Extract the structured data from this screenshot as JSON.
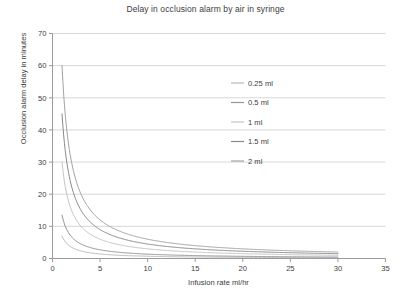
{
  "chart_data": {
    "type": "line",
    "title": "Delay in occlusion alarm by air in syringe",
    "xlabel": "Infusion rate ml/hr",
    "ylabel": "Occlusion alarm delay in minutes",
    "xlim": [
      0,
      35
    ],
    "ylim": [
      0,
      70
    ],
    "xticks": [
      0,
      5,
      10,
      15,
      20,
      25,
      30,
      35
    ],
    "yticks": [
      0,
      10,
      20,
      30,
      40,
      50,
      60,
      70
    ],
    "grid": "horizontal",
    "legend_position": "upper-center-right",
    "x_domain_of_curves": [
      1,
      30
    ],
    "series": [
      {
        "name": "0.25 ml",
        "color": "#b9b9b9",
        "k": 7.0,
        "points": [
          {
            "x": 1,
            "y": 7.0
          },
          {
            "x": 2,
            "y": 3.5
          },
          {
            "x": 3,
            "y": 2.33
          },
          {
            "x": 4,
            "y": 1.75
          },
          {
            "x": 5,
            "y": 1.4
          },
          {
            "x": 7.5,
            "y": 0.93
          },
          {
            "x": 10,
            "y": 0.7
          },
          {
            "x": 15,
            "y": 0.47
          },
          {
            "x": 20,
            "y": 0.35
          },
          {
            "x": 25,
            "y": 0.28
          },
          {
            "x": 30,
            "y": 0.23
          }
        ]
      },
      {
        "name": "0.5 ml",
        "color": "#949494",
        "k": 13.5,
        "points": [
          {
            "x": 1,
            "y": 13.5
          },
          {
            "x": 2,
            "y": 6.75
          },
          {
            "x": 3,
            "y": 4.5
          },
          {
            "x": 4,
            "y": 3.38
          },
          {
            "x": 5,
            "y": 2.7
          },
          {
            "x": 7.5,
            "y": 1.8
          },
          {
            "x": 10,
            "y": 1.35
          },
          {
            "x": 15,
            "y": 0.9
          },
          {
            "x": 20,
            "y": 0.68
          },
          {
            "x": 25,
            "y": 0.54
          },
          {
            "x": 30,
            "y": 0.45
          }
        ]
      },
      {
        "name": "1 ml",
        "color": "#c4c4c4",
        "k": 30.0,
        "points": [
          {
            "x": 1,
            "y": 30.0
          },
          {
            "x": 2,
            "y": 15.0
          },
          {
            "x": 3,
            "y": 10.0
          },
          {
            "x": 4,
            "y": 7.5
          },
          {
            "x": 5,
            "y": 6.0
          },
          {
            "x": 7.5,
            "y": 4.0
          },
          {
            "x": 10,
            "y": 3.0
          },
          {
            "x": 15,
            "y": 2.0
          },
          {
            "x": 20,
            "y": 1.5
          },
          {
            "x": 25,
            "y": 1.2
          },
          {
            "x": 30,
            "y": 1.0
          }
        ]
      },
      {
        "name": "1.5 ml",
        "color": "#8a8a8a",
        "k": 45.0,
        "points": [
          {
            "x": 1,
            "y": 45.0
          },
          {
            "x": 2,
            "y": 22.5
          },
          {
            "x": 3,
            "y": 15.0
          },
          {
            "x": 4,
            "y": 11.25
          },
          {
            "x": 5,
            "y": 9.0
          },
          {
            "x": 7.5,
            "y": 6.0
          },
          {
            "x": 10,
            "y": 4.5
          },
          {
            "x": 15,
            "y": 3.0
          },
          {
            "x": 20,
            "y": 2.25
          },
          {
            "x": 25,
            "y": 1.8
          },
          {
            "x": 30,
            "y": 1.5
          }
        ]
      },
      {
        "name": "2 ml",
        "color": "#a3a3a3",
        "k": 60.0,
        "points": [
          {
            "x": 1,
            "y": 60.0
          },
          {
            "x": 2,
            "y": 30.0
          },
          {
            "x": 3,
            "y": 20.0
          },
          {
            "x": 4,
            "y": 15.0
          },
          {
            "x": 5,
            "y": 12.0
          },
          {
            "x": 7.5,
            "y": 8.0
          },
          {
            "x": 10,
            "y": 6.0
          },
          {
            "x": 15,
            "y": 4.0
          },
          {
            "x": 20,
            "y": 3.0
          },
          {
            "x": 25,
            "y": 2.4
          },
          {
            "x": 30,
            "y": 2.0
          }
        ]
      }
    ]
  },
  "style": {
    "axis_color": "#9a9a9a",
    "grid_color": "#d8d8d8",
    "text_color": "#3c3c3c",
    "background": "#ffffff"
  }
}
